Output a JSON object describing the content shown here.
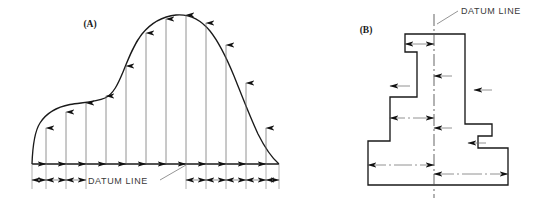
{
  "figure": {
    "title_visible": false,
    "background_color": "#ffffff",
    "line_color": "#1a1a1a",
    "dimension_color": "#6d6d6d",
    "text_color": "#3a3a3a",
    "width": 546,
    "height": 207
  },
  "panels": [
    {
      "key": "A",
      "label": "(A)",
      "label_x": 90,
      "label_y": 27,
      "datum_label": "DATUM LINE",
      "datum_label_x": 88,
      "datum_label_y": 184,
      "description_type": "irregular-curved-profile-with-ordinate-dimensions",
      "baseline_y": 164,
      "baseline_x_start": 32,
      "baseline_x_end": 279,
      "profile_points": [
        {
          "x": 32,
          "y": 164
        },
        {
          "x": 36,
          "y": 140
        },
        {
          "x": 48,
          "y": 120
        },
        {
          "x": 62,
          "y": 110
        },
        {
          "x": 78,
          "y": 104
        },
        {
          "x": 95,
          "y": 101
        },
        {
          "x": 108,
          "y": 96
        },
        {
          "x": 120,
          "y": 80
        },
        {
          "x": 134,
          "y": 52
        },
        {
          "x": 150,
          "y": 30
        },
        {
          "x": 168,
          "y": 18
        },
        {
          "x": 184,
          "y": 15
        },
        {
          "x": 200,
          "y": 20
        },
        {
          "x": 216,
          "y": 33
        },
        {
          "x": 232,
          "y": 55
        },
        {
          "x": 248,
          "y": 85
        },
        {
          "x": 262,
          "y": 118
        },
        {
          "x": 272,
          "y": 146
        },
        {
          "x": 279,
          "y": 164
        }
      ],
      "ordinate_arrows": [
        {
          "x": 46,
          "top_y": 128,
          "bottom_y": 164
        },
        {
          "x": 66,
          "top_y": 112,
          "bottom_y": 164
        },
        {
          "x": 86,
          "top_y": 103,
          "bottom_y": 164
        },
        {
          "x": 106,
          "top_y": 96,
          "bottom_y": 164
        },
        {
          "x": 126,
          "top_y": 66,
          "bottom_y": 164
        },
        {
          "x": 146,
          "top_y": 33,
          "bottom_y": 164
        },
        {
          "x": 166,
          "top_y": 19,
          "bottom_y": 164
        },
        {
          "x": 186,
          "top_y": 15,
          "bottom_y": 164
        },
        {
          "x": 206,
          "top_y": 23,
          "bottom_y": 164
        },
        {
          "x": 226,
          "top_y": 45,
          "bottom_y": 164
        },
        {
          "x": 246,
          "top_y": 83,
          "bottom_y": 164
        },
        {
          "x": 266,
          "top_y": 128,
          "bottom_y": 164
        }
      ],
      "arrow_count": 12,
      "dimension_row_y": 180,
      "dimension_segments": [
        {
          "x1": 32,
          "x2": 46
        },
        {
          "x1": 46,
          "x2": 66
        },
        {
          "x1": 66,
          "x2": 86
        },
        {
          "x1": 186,
          "x2": 206
        },
        {
          "x1": 206,
          "x2": 226
        },
        {
          "x1": 226,
          "x2": 246
        },
        {
          "x1": 246,
          "x2": 266
        },
        {
          "x1": 266,
          "x2": 279
        }
      ],
      "leader": {
        "x1": 160,
        "y1": 181,
        "x2": 186,
        "y2": 166
      }
    },
    {
      "key": "B",
      "label": "(B)",
      "label_x": 366,
      "label_y": 33,
      "datum_label": "DATUM LINE",
      "datum_label_x": 462,
      "datum_label_y": 13,
      "description_type": "stepped-rectilinear-profile-with-ordinate-dimensions",
      "centerline_x": 434,
      "centerline_y_top": 14,
      "centerline_y_bottom": 198,
      "profile_points": [
        {
          "x": 405,
          "y": 34
        },
        {
          "x": 465,
          "y": 34
        },
        {
          "x": 465,
          "y": 124
        },
        {
          "x": 492,
          "y": 124
        },
        {
          "x": 492,
          "y": 136
        },
        {
          "x": 478,
          "y": 136
        },
        {
          "x": 478,
          "y": 148
        },
        {
          "x": 508,
          "y": 148
        },
        {
          "x": 508,
          "y": 185
        },
        {
          "x": 368,
          "y": 185
        },
        {
          "x": 368,
          "y": 141
        },
        {
          "x": 390,
          "y": 141
        },
        {
          "x": 390,
          "y": 97
        },
        {
          "x": 417,
          "y": 97
        },
        {
          "x": 417,
          "y": 52
        },
        {
          "x": 405,
          "y": 52
        }
      ],
      "dimensions_left_of_datum": [
        {
          "from_x": 405,
          "to_x": 434,
          "y": 44
        },
        {
          "from_x": 390,
          "to_x": 434,
          "y": 86
        },
        {
          "from_x": 368,
          "to_x": 434,
          "y": 118
        },
        {
          "from_x": 368,
          "to_x": 434,
          "y": 165
        }
      ],
      "dimensions_right_of_datum": [
        {
          "from_x": 434,
          "to_x": 465,
          "y": 76
        },
        {
          "from_x": 434,
          "to_x": 492,
          "y": 90
        },
        {
          "from_x": 434,
          "to_x": 478,
          "y": 128
        },
        {
          "from_x": 434,
          "to_x": 492,
          "y": 143
        },
        {
          "from_x": 434,
          "to_x": 508,
          "y": 174
        }
      ],
      "leader": {
        "x1": 440,
        "y1": 22,
        "x2": 458,
        "y2": 10
      }
    }
  ],
  "annotations": {
    "datum_line_text": "DATUM LINE",
    "panel_a_text": "(A)",
    "panel_b_text": "(B)"
  }
}
